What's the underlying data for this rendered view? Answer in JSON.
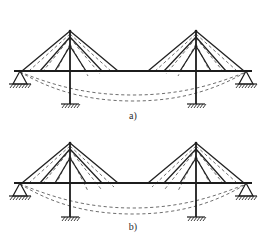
{
  "figure": {
    "panels": [
      {
        "id": "a",
        "caption": "a)",
        "description": "Two-mast cable-stayed beam, fan stay arrangement, deflected shape shown dashed"
      },
      {
        "id": "b",
        "caption": "b)",
        "description": "Two-mast cable-stayed beam, alternative stay arrangement, deflected shape shown dashed"
      }
    ]
  },
  "colors": {
    "member": "#1c1c1c",
    "chord": "#1c1c1c",
    "stay": "#222222",
    "deflection": "#6e6e6e",
    "background": "#ffffff",
    "hatch": "#2a2a2a"
  },
  "geometry": {
    "panel_a": {
      "beam": {
        "x1": 14,
        "y": 71,
        "x2": 252
      },
      "masts": [
        {
          "x": 70,
          "top": 31,
          "base": 71,
          "label": "left-mast"
        },
        {
          "x": 196,
          "top": 31,
          "base": 71,
          "label": "right-mast"
        }
      ],
      "columns": [
        {
          "x": 70,
          "top": 71,
          "bottom": 104,
          "label": "left-column"
        },
        {
          "x": 196,
          "top": 71,
          "bottom": 104,
          "label": "right-column"
        }
      ],
      "supports": [
        {
          "type": "pin",
          "x": 20,
          "y": 71,
          "label": "left-end-support"
        },
        {
          "type": "pin",
          "x": 246,
          "y": 71,
          "label": "right-end-support"
        },
        {
          "type": "fixed-base",
          "x": 70,
          "y": 104,
          "label": "left-column-base"
        },
        {
          "type": "fixed-base",
          "x": 196,
          "y": 104,
          "label": "right-column-base"
        }
      ],
      "left_stay_nodes": [
        22,
        40,
        55,
        86,
        102,
        118
      ],
      "right_stay_nodes": [
        148,
        164,
        180,
        211,
        226,
        244
      ],
      "deflection_curve": "M 20 72 C 52 86, 84 100, 133 100 C 182 100, 214 86, 246 72"
    },
    "panel_b": {
      "beam": {
        "x1": 14,
        "y": 58,
        "x2": 252
      },
      "masts": [
        {
          "x": 70,
          "top": 18,
          "base": 58,
          "label": "left-mast"
        },
        {
          "x": 196,
          "top": 18,
          "base": 58,
          "label": "right-mast"
        }
      ],
      "columns": [
        {
          "x": 70,
          "top": 58,
          "bottom": 92,
          "label": "left-column"
        },
        {
          "x": 196,
          "top": 58,
          "bottom": 92,
          "label": "right-column"
        }
      ],
      "supports": [
        {
          "type": "pin",
          "x": 20,
          "y": 58,
          "label": "left-end-support"
        },
        {
          "type": "pin",
          "x": 246,
          "y": 58,
          "label": "right-end-support"
        },
        {
          "type": "fixed-base",
          "x": 70,
          "y": 92,
          "label": "left-column-base"
        },
        {
          "type": "fixed-base",
          "x": 196,
          "y": 92,
          "label": "right-column-base"
        }
      ],
      "left_stay_nodes": [
        22,
        40,
        55,
        86,
        102,
        118
      ],
      "right_stay_nodes": [
        148,
        164,
        180,
        211,
        226,
        244
      ],
      "deflection_curve": "M 20 59 C 52 73, 84 88, 133 88 C 182 88, 214 73, 246 59"
    }
  }
}
